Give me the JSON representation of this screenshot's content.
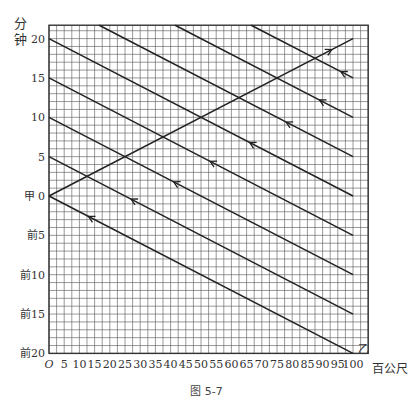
{
  "caption": "图 5-7",
  "chart_data": {
    "type": "line",
    "title": "",
    "caption": "图 5-7",
    "xlabel": "百公尺",
    "ylabel": "分钟",
    "xlim": [
      0,
      105
    ],
    "ylim": [
      -20,
      21.7
    ],
    "grid": true,
    "x_ticks": [
      0,
      5,
      10,
      15,
      20,
      25,
      30,
      35,
      40,
      45,
      50,
      55,
      60,
      65,
      70,
      75,
      80,
      85,
      90,
      95,
      100
    ],
    "x_tick_labels": [
      "O",
      "5",
      "10",
      "15",
      "20",
      "25",
      "30",
      "35",
      "40",
      "45",
      "50",
      "55",
      "60",
      "65",
      "70",
      "75",
      "80",
      "85",
      "90",
      "95",
      "100"
    ],
    "y_ticks": [
      20,
      15,
      10,
      5,
      0,
      -5,
      -10,
      -15,
      -20
    ],
    "y_tick_labels": [
      "20",
      "15",
      "10",
      "5",
      "甲 0",
      "前5",
      "前10",
      "前15",
      "前20"
    ],
    "annotations": [
      {
        "text": "甲",
        "x": 0,
        "y": 0
      },
      {
        "text": "乙",
        "x": 101,
        "y": -19.5
      }
    ],
    "series": [
      {
        "name": "甲",
        "direction": "forward",
        "points": [
          [
            0,
            0
          ],
          [
            100,
            20
          ]
        ],
        "arrow_at": [
          93,
          18.6
        ]
      },
      {
        "name": "乙-1",
        "direction": "backward",
        "points": [
          [
            0,
            0
          ],
          [
            100,
            -20
          ]
        ],
        "arrow_at": [
          13,
          -2.6
        ]
      },
      {
        "name": "乙-2",
        "direction": "backward",
        "points": [
          [
            0,
            5
          ],
          [
            100,
            -15
          ]
        ],
        "arrow_at": [
          27,
          -0.4
        ]
      },
      {
        "name": "乙-3",
        "direction": "backward",
        "points": [
          [
            0,
            10
          ],
          [
            100,
            -10
          ]
        ],
        "arrow_at": [
          41,
          1.8
        ]
      },
      {
        "name": "乙-4",
        "direction": "backward",
        "points": [
          [
            0,
            15
          ],
          [
            100,
            -5
          ]
        ],
        "arrow_at": [
          53,
          4.4
        ]
      },
      {
        "name": "乙-5",
        "direction": "backward",
        "points": [
          [
            0,
            20
          ],
          [
            100,
            0
          ]
        ],
        "arrow_at": [
          66,
          6.8
        ]
      },
      {
        "name": "乙-6",
        "direction": "backward",
        "points": [
          [
            16.5,
            21.7
          ],
          [
            100,
            5
          ]
        ],
        "arrow_at": [
          78,
          9.4
        ]
      },
      {
        "name": "乙-7",
        "direction": "backward",
        "points": [
          [
            41.5,
            21.7
          ],
          [
            100,
            10
          ]
        ],
        "arrow_at": [
          89,
          12.2
        ]
      },
      {
        "name": "乙-8",
        "direction": "backward",
        "points": [
          [
            66.5,
            21.7
          ],
          [
            100,
            15
          ]
        ],
        "arrow_at": [
          96,
          15.8
        ]
      }
    ]
  }
}
